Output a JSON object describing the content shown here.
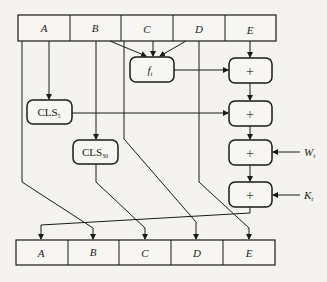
{
  "diagram": {
    "top_register": {
      "cells": [
        "A",
        "B",
        "C",
        "D",
        "E"
      ]
    },
    "bottom_register": {
      "cells": [
        "A",
        "B",
        "C",
        "D",
        "E"
      ]
    },
    "function_box": {
      "label": "f",
      "subscript": "t"
    },
    "shift_boxes": [
      {
        "label": "CLS",
        "subscript": "5"
      },
      {
        "label": "CLS",
        "subscript": "30"
      }
    ],
    "adders": [
      {
        "symbol": "+"
      },
      {
        "symbol": "+"
      },
      {
        "symbol": "+"
      },
      {
        "symbol": "+"
      }
    ],
    "inputs": [
      {
        "label": "W",
        "subscript": "t"
      },
      {
        "label": "K",
        "subscript": "t"
      }
    ],
    "colors": {
      "line": "#1a1a1a",
      "background": "#f4f3f0",
      "cell_fill": "#f7f6f3"
    }
  }
}
